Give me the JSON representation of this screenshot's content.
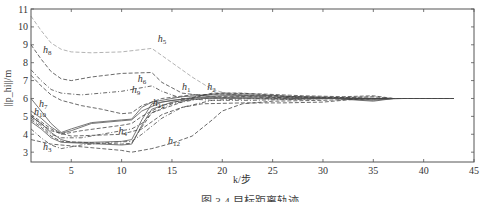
{
  "chart_data": {
    "type": "line",
    "title": "",
    "xlabel": "k/步",
    "ylabel": "||p_hi||/m",
    "xlim": [
      1,
      45
    ],
    "ylim": [
      2.45,
      11
    ],
    "xticks": [
      5,
      10,
      15,
      20,
      25,
      30,
      35,
      40,
      45
    ],
    "yticks": [
      3,
      4,
      5,
      6,
      7,
      8,
      9,
      10,
      11
    ],
    "grid": false,
    "caption": "图 3-4  目标距离轨迹",
    "series": [
      {
        "name": "h5",
        "style": "dashed-light",
        "points": [
          [
            1,
            10.6
          ],
          [
            2,
            9.8
          ],
          [
            3,
            9.1
          ],
          [
            4,
            8.75
          ],
          [
            5,
            8.6
          ],
          [
            7,
            8.55
          ],
          [
            10,
            8.6
          ],
          [
            13,
            8.8
          ],
          [
            15,
            8.0
          ],
          [
            17,
            7.2
          ],
          [
            19,
            6.5
          ],
          [
            21,
            6.2
          ],
          [
            25,
            6.05
          ],
          [
            30,
            6.0
          ],
          [
            36,
            6.0
          ],
          [
            43,
            6.0
          ]
        ]
      },
      {
        "name": "h8",
        "style": "dashed",
        "points": [
          [
            1,
            9.0
          ],
          [
            2,
            8.2
          ],
          [
            3,
            7.5
          ],
          [
            4,
            7.1
          ],
          [
            5,
            7.0
          ],
          [
            7,
            7.2
          ],
          [
            10,
            7.4
          ],
          [
            13,
            7.45
          ],
          [
            14,
            6.9
          ],
          [
            16,
            6.3
          ],
          [
            19,
            6.1
          ],
          [
            22,
            6.1
          ],
          [
            26,
            6.05
          ],
          [
            30,
            6.0
          ],
          [
            36,
            6.0
          ],
          [
            43,
            6.0
          ]
        ]
      },
      {
        "name": "h6",
        "style": "dash-dot",
        "points": [
          [
            1,
            7.6
          ],
          [
            2,
            7.0
          ],
          [
            3,
            6.5
          ],
          [
            4,
            6.3
          ],
          [
            6,
            6.2
          ],
          [
            10,
            6.4
          ],
          [
            13,
            6.7
          ],
          [
            14,
            6.4
          ],
          [
            16,
            6.0
          ],
          [
            19,
            5.9
          ],
          [
            23,
            5.9
          ],
          [
            27,
            5.95
          ],
          [
            31,
            6.0
          ],
          [
            36,
            6.0
          ],
          [
            43,
            6.0
          ]
        ]
      },
      {
        "name": "h9",
        "style": "dashed",
        "points": [
          [
            1,
            7.3
          ],
          [
            2,
            6.7
          ],
          [
            3,
            6.2
          ],
          [
            4,
            5.9
          ],
          [
            6,
            5.6
          ],
          [
            8,
            5.4
          ],
          [
            10,
            5.15
          ],
          [
            11,
            5.2
          ],
          [
            12,
            5.6
          ],
          [
            14,
            6.0
          ],
          [
            17,
            6.2
          ],
          [
            20,
            6.25
          ],
          [
            25,
            6.1
          ],
          [
            30,
            6.05
          ],
          [
            36,
            6.0
          ],
          [
            43,
            6.0
          ]
        ]
      },
      {
        "name": "h7",
        "style": "solid",
        "points": [
          [
            1,
            6.0
          ],
          [
            2,
            5.3
          ],
          [
            3,
            4.6
          ],
          [
            4,
            4.1
          ],
          [
            5,
            4.3
          ],
          [
            7,
            4.65
          ],
          [
            10,
            4.8
          ],
          [
            11,
            4.85
          ],
          [
            12,
            5.5
          ],
          [
            13,
            5.8
          ],
          [
            16,
            6.1
          ],
          [
            19,
            6.2
          ],
          [
            23,
            6.2
          ],
          [
            27,
            6.1
          ],
          [
            32,
            6.05
          ],
          [
            36,
            6.0
          ],
          [
            43,
            6.0
          ]
        ]
      },
      {
        "name": "h10",
        "style": "solid",
        "points": [
          [
            1,
            5.3
          ],
          [
            2,
            4.9
          ],
          [
            3,
            4.4
          ],
          [
            4,
            4.05
          ],
          [
            5,
            4.2
          ],
          [
            7,
            4.6
          ],
          [
            10,
            4.75
          ],
          [
            11,
            4.8
          ],
          [
            12,
            5.3
          ],
          [
            14,
            5.8
          ],
          [
            17,
            6.05
          ],
          [
            20,
            6.15
          ],
          [
            25,
            6.15
          ],
          [
            30,
            6.05
          ],
          [
            35,
            5.95
          ],
          [
            38,
            6.0
          ],
          [
            43,
            6.0
          ]
        ]
      },
      {
        "name": "h4",
        "style": "dash-dot",
        "points": [
          [
            1,
            4.9
          ],
          [
            2,
            4.5
          ],
          [
            3,
            4.0
          ],
          [
            4,
            3.8
          ],
          [
            6,
            3.8
          ],
          [
            9,
            4.1
          ],
          [
            11,
            4.3
          ],
          [
            12,
            4.6
          ],
          [
            13,
            5.2
          ],
          [
            15,
            5.7
          ],
          [
            18,
            6.0
          ],
          [
            22,
            6.1
          ],
          [
            27,
            6.05
          ],
          [
            32,
            6.0
          ],
          [
            36,
            6.0
          ],
          [
            43,
            6.0
          ]
        ]
      },
      {
        "name": "h3",
        "style": "dash-dot",
        "points": [
          [
            1,
            4.3
          ],
          [
            2,
            3.8
          ],
          [
            3,
            3.4
          ],
          [
            4,
            3.2
          ],
          [
            6,
            3.4
          ],
          [
            9,
            3.55
          ],
          [
            11,
            3.6
          ],
          [
            12,
            4.0
          ],
          [
            14,
            4.9
          ],
          [
            16,
            5.5
          ],
          [
            19,
            5.9
          ],
          [
            23,
            6.0
          ],
          [
            28,
            6.0
          ],
          [
            34,
            6.0
          ],
          [
            43,
            6.0
          ]
        ]
      },
      {
        "name": "h12",
        "style": "dashed",
        "points": [
          [
            1,
            3.7
          ],
          [
            3,
            3.45
          ],
          [
            5,
            3.35
          ],
          [
            8,
            3.2
          ],
          [
            10,
            3.1
          ],
          [
            11,
            3.0
          ],
          [
            13,
            3.2
          ],
          [
            15,
            3.5
          ],
          [
            17,
            3.9
          ],
          [
            19,
            4.8
          ],
          [
            20,
            5.3
          ],
          [
            22,
            5.7
          ],
          [
            25,
            5.85
          ],
          [
            30,
            5.9
          ],
          [
            33,
            5.95
          ],
          [
            36,
            6.0
          ],
          [
            43,
            6.0
          ]
        ]
      },
      {
        "name": "h11",
        "style": "solid",
        "points": [
          [
            1,
            5.0
          ],
          [
            2,
            4.6
          ],
          [
            3,
            4.1
          ],
          [
            4,
            3.7
          ],
          [
            5,
            3.55
          ],
          [
            7,
            3.55
          ],
          [
            10,
            3.6
          ],
          [
            11,
            3.7
          ],
          [
            12,
            4.8
          ],
          [
            13,
            5.7
          ],
          [
            15,
            5.9
          ],
          [
            18,
            6.05
          ],
          [
            22,
            6.05
          ],
          [
            27,
            6.0
          ],
          [
            31,
            6.0
          ],
          [
            35,
            5.9
          ],
          [
            37,
            6.0
          ],
          [
            43,
            6.0
          ]
        ]
      },
      {
        "name": "h1",
        "style": "dashed",
        "points": [
          [
            1,
            4.8
          ],
          [
            2,
            4.4
          ],
          [
            3,
            3.9
          ],
          [
            4,
            3.6
          ],
          [
            6,
            3.55
          ],
          [
            10,
            3.45
          ],
          [
            11,
            3.5
          ],
          [
            12,
            4.4
          ],
          [
            13,
            5.2
          ],
          [
            15,
            5.6
          ],
          [
            17,
            6.0
          ],
          [
            19,
            6.3
          ],
          [
            22,
            6.3
          ],
          [
            27,
            6.1
          ],
          [
            32,
            6.05
          ],
          [
            35,
            6.1
          ],
          [
            37,
            6.0
          ],
          [
            43,
            6.0
          ]
        ]
      },
      {
        "name": "h2",
        "style": "dashed",
        "points": [
          [
            1,
            5.1
          ],
          [
            2,
            4.7
          ],
          [
            3,
            4.3
          ],
          [
            4,
            4.0
          ],
          [
            6,
            4.2
          ],
          [
            10,
            4.5
          ],
          [
            11,
            4.6
          ],
          [
            12,
            5.0
          ],
          [
            14,
            5.6
          ],
          [
            16,
            5.9
          ],
          [
            18,
            6.2
          ],
          [
            20,
            6.3
          ],
          [
            24,
            6.25
          ],
          [
            28,
            6.15
          ],
          [
            32,
            6.1
          ],
          [
            35,
            6.15
          ],
          [
            37,
            6.0
          ],
          [
            43,
            6.0
          ]
        ]
      },
      {
        "name": "h13",
        "style": "solid",
        "points": [
          [
            1,
            4.7
          ],
          [
            2,
            4.3
          ],
          [
            3,
            3.8
          ],
          [
            4,
            3.55
          ],
          [
            6,
            3.5
          ],
          [
            10,
            3.4
          ],
          [
            11,
            3.45
          ],
          [
            12,
            4.5
          ],
          [
            13,
            5.4
          ],
          [
            15,
            5.8
          ],
          [
            18,
            6.0
          ],
          [
            22,
            6.0
          ],
          [
            27,
            5.95
          ],
          [
            31,
            6.0
          ],
          [
            35,
            5.85
          ],
          [
            37,
            6.0
          ],
          [
            43,
            6.0
          ]
        ]
      },
      {
        "name": "h14",
        "style": "dashed",
        "points": [
          [
            1,
            5.0
          ],
          [
            3,
            4.2
          ],
          [
            5,
            3.9
          ],
          [
            10,
            4.0
          ],
          [
            12,
            4.3
          ],
          [
            14,
            5.1
          ],
          [
            16,
            5.5
          ],
          [
            18,
            5.7
          ],
          [
            22,
            5.75
          ],
          [
            26,
            5.75
          ],
          [
            30,
            5.8
          ],
          [
            33,
            5.95
          ],
          [
            36,
            6.0
          ],
          [
            43,
            6.0
          ]
        ]
      }
    ],
    "labels": [
      {
        "base": "h",
        "sub": "5",
        "k": 13.6,
        "v": 9.15
      },
      {
        "base": "h",
        "sub": "8",
        "k": 2.2,
        "v": 8.55
      },
      {
        "base": "h",
        "sub": "6",
        "k": 11.6,
        "v": 6.9
      },
      {
        "base": "h",
        "sub": "9",
        "k": 11.0,
        "v": 6.3
      },
      {
        "base": "h",
        "sub": "7",
        "k": 1.8,
        "v": 5.55
      },
      {
        "base": "h",
        "sub": "10",
        "k": 1.3,
        "v": 5.05
      },
      {
        "base": "h",
        "sub": "4",
        "k": 9.7,
        "v": 4.0
      },
      {
        "base": "h",
        "sub": "3",
        "k": 2.2,
        "v": 3.1
      },
      {
        "base": "h",
        "sub": "12",
        "k": 14.6,
        "v": 3.45
      },
      {
        "base": "h",
        "sub": "11",
        "k": 13.1,
        "v": 5.6
      },
      {
        "base": "h",
        "sub": "1",
        "k": 16.0,
        "v": 6.45
      },
      {
        "base": "h",
        "sub": "2",
        "k": 18.5,
        "v": 6.45
      }
    ]
  }
}
